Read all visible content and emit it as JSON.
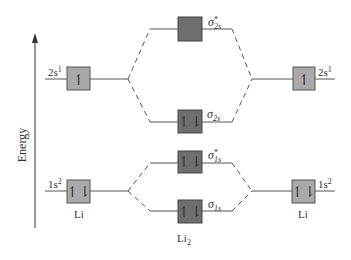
{
  "diagram": {
    "axis": {
      "label": "Energy"
    },
    "colors": {
      "atomic_box": "#a9a9a9",
      "molecular_box": "#6e6e6e",
      "line": "#555555",
      "box_border": "#555555"
    },
    "left_atom": {
      "label": "Li",
      "orbitals": [
        {
          "name": "2s",
          "config_main": "2s",
          "config_sup": "1",
          "electrons": "↿"
        },
        {
          "name": "1s",
          "config_main": "1s",
          "config_sup": "2",
          "electrons": "↿⇂"
        }
      ]
    },
    "right_atom": {
      "label": "Li",
      "orbitals": [
        {
          "name": "2s",
          "config_main": "2s",
          "config_sup": "1",
          "electrons": "↿"
        },
        {
          "name": "1s",
          "config_main": "1s",
          "config_sup": "2",
          "electrons": "↿⇂"
        }
      ]
    },
    "molecule": {
      "label_main": "Li",
      "label_sub": "2",
      "orbitals": [
        {
          "name": "sigma*2s",
          "symbol": "σ",
          "star": "*",
          "sub": "2s",
          "electrons": ""
        },
        {
          "name": "sigma2s",
          "symbol": "σ",
          "star": "",
          "sub": "2s",
          "electrons": "↿⇂"
        },
        {
          "name": "sigma*1s",
          "symbol": "σ",
          "star": "*",
          "sub": "1s",
          "electrons": "↿⇂"
        },
        {
          "name": "sigma1s",
          "symbol": "σ",
          "star": "",
          "sub": "1s",
          "electrons": "↿⇂"
        }
      ]
    }
  }
}
